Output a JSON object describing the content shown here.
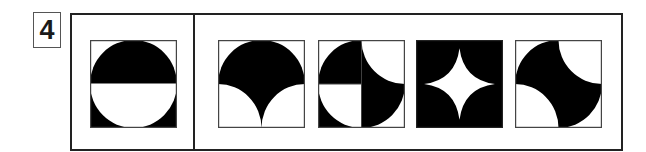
{
  "question": {
    "number": "4"
  },
  "colors": {
    "ink": "#000000",
    "paper": "#ffffff",
    "frame": "#222222",
    "box_border": "#444444"
  },
  "figures": [
    {
      "id": "given",
      "role": "question-figure",
      "description": "top-half-black-semicircle-bottom-half-white-semicircle-with-black-corners"
    },
    {
      "id": "option-1",
      "role": "answer-option",
      "description": "black-semicircle-top-with-cusp-bottom"
    },
    {
      "id": "option-2",
      "role": "answer-option",
      "description": "quadrant-mixed-arcs"
    },
    {
      "id": "option-3",
      "role": "answer-option",
      "description": "black-square-with-white-four-point-star"
    },
    {
      "id": "option-4",
      "role": "answer-option",
      "description": "circle-minus-tr-and-bl-quarter-circles"
    }
  ]
}
